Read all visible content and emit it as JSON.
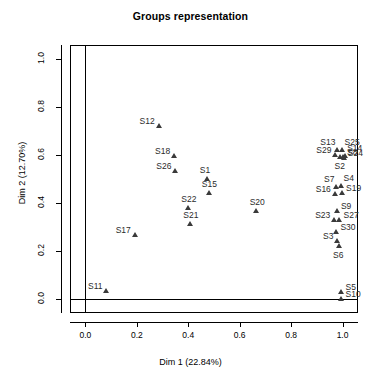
{
  "chart_data": {
    "type": "scatter",
    "title": "Groups representation",
    "xlabel": "Dim 1 (22.84%)",
    "ylabel": "Dim 2 (12.70%)",
    "xlim": [
      -0.06,
      1.06
    ],
    "ylim": [
      -0.06,
      1.06
    ],
    "xticks": [
      "0.0",
      "0.2",
      "0.4",
      "0.6",
      "0.8",
      "1.0"
    ],
    "xtickvalues": [
      0.0,
      0.2,
      0.4,
      0.6,
      0.8,
      1.0
    ],
    "yticks": [
      "0.0",
      "0.2",
      "0.4",
      "0.6",
      "0.8",
      "1.0"
    ],
    "ytickvalues": [
      0.0,
      0.2,
      0.4,
      0.6,
      0.8,
      1.0
    ],
    "grid": false,
    "legend": "none",
    "marker": "triangle",
    "marker_color": "#3a3a3a",
    "points": [
      {
        "label": "S12",
        "x": 0.285,
        "y": 0.72,
        "lab": "lab-left"
      },
      {
        "label": "S18",
        "x": 0.345,
        "y": 0.598,
        "lab": "lab-left"
      },
      {
        "label": "S26",
        "x": 0.35,
        "y": 0.535,
        "lab": "lab-left"
      },
      {
        "label": "S1",
        "x": 0.472,
        "y": 0.498,
        "lab": "lab-above"
      },
      {
        "label": "S15",
        "x": 0.48,
        "y": 0.442,
        "lab": "lab-above"
      },
      {
        "label": "S22",
        "x": 0.4,
        "y": 0.378,
        "lab": "lab-above"
      },
      {
        "label": "S21",
        "x": 0.408,
        "y": 0.31,
        "lab": "lab-above"
      },
      {
        "label": "S20",
        "x": 0.666,
        "y": 0.368,
        "lab": "lab-above"
      },
      {
        "label": "S17",
        "x": 0.192,
        "y": 0.265,
        "lab": "lab-left"
      },
      {
        "label": "S11",
        "x": 0.082,
        "y": 0.03,
        "lab": "lab-left"
      },
      {
        "label": "S13",
        "x": 0.98,
        "y": 0.62,
        "lab": "lab-ul"
      },
      {
        "label": "S25",
        "x": 1.0,
        "y": 0.622,
        "lab": "lab-ur"
      },
      {
        "label": "S29",
        "x": 0.972,
        "y": 0.6,
        "lab": "lab-left"
      },
      {
        "label": "S2",
        "x": 0.992,
        "y": 0.592,
        "lab": "lab-below"
      },
      {
        "label": "S8",
        "x": 1.002,
        "y": 0.594,
        "lab": "lab-right"
      },
      {
        "label": "S14",
        "x": 1.01,
        "y": 0.596,
        "lab": "lab-ur"
      },
      {
        "label": "S24",
        "x": 1.005,
        "y": 0.588,
        "lab": "lab-right"
      },
      {
        "label": "S7",
        "x": 0.976,
        "y": 0.468,
        "lab": "lab-ul"
      },
      {
        "label": "S4",
        "x": 0.996,
        "y": 0.47,
        "lab": "lab-ur"
      },
      {
        "label": "S19",
        "x": 0.998,
        "y": 0.44,
        "lab": "lab-right"
      },
      {
        "label": "S16",
        "x": 0.97,
        "y": 0.438,
        "lab": "lab-left"
      },
      {
        "label": "S9",
        "x": 0.978,
        "y": 0.368,
        "lab": "lab-right"
      },
      {
        "label": "S23",
        "x": 0.968,
        "y": 0.33,
        "lab": "lab-left"
      },
      {
        "label": "S27",
        "x": 0.988,
        "y": 0.328,
        "lab": "lab-right"
      },
      {
        "label": "S30",
        "x": 0.976,
        "y": 0.278,
        "lab": "lab-right"
      },
      {
        "label": "S3",
        "x": 0.98,
        "y": 0.24,
        "lab": "lab-left"
      },
      {
        "label": "S6",
        "x": 0.986,
        "y": 0.222,
        "lab": "lab-below"
      },
      {
        "label": "S5",
        "x": 0.996,
        "y": 0.028,
        "lab": "lab-right"
      },
      {
        "label": "S10",
        "x": 0.996,
        "y": 0.0,
        "lab": "lab-right"
      }
    ]
  }
}
